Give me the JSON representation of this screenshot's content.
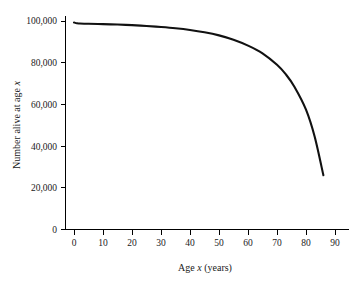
{
  "chart_data": {
    "type": "line",
    "title": "",
    "subtitle": "",
    "xlabel_parts": {
      "pre": "Age ",
      "italic": "x",
      "post": " (years)"
    },
    "xlabel": "Age x (years)",
    "ylabel_parts": {
      "pre": "Number alive at age ",
      "italic": "x",
      "post": ""
    },
    "ylabel": "Number alive at age x",
    "xlim": [
      0,
      96
    ],
    "ylim": [
      0,
      104000
    ],
    "grid": false,
    "legend": null,
    "xticks": [
      0,
      10,
      20,
      30,
      40,
      50,
      60,
      70,
      80,
      90
    ],
    "xtick_labels": [
      "0",
      "10",
      "20",
      "30",
      "40",
      "50",
      "60",
      "70",
      "80",
      "90"
    ],
    "yticks": [
      0,
      20000,
      40000,
      60000,
      80000,
      100000
    ],
    "ytick_labels": [
      "0",
      "20,000",
      "40,000",
      "60,000",
      "80,000",
      "100,000"
    ],
    "series": [
      {
        "name": "Number alive at age x",
        "color": "#111111",
        "x": [
          0,
          1,
          2,
          5,
          10,
          15,
          20,
          25,
          30,
          35,
          40,
          45,
          50,
          55,
          60,
          65,
          70,
          73,
          76,
          80,
          83,
          86
        ],
        "values": [
          99300,
          98900,
          98800,
          98650,
          98500,
          98300,
          98000,
          97600,
          97100,
          96500,
          95700,
          94600,
          93100,
          91000,
          88200,
          84500,
          79000,
          74500,
          68500,
          57500,
          44500,
          26000
        ]
      }
    ],
    "annotations": []
  }
}
